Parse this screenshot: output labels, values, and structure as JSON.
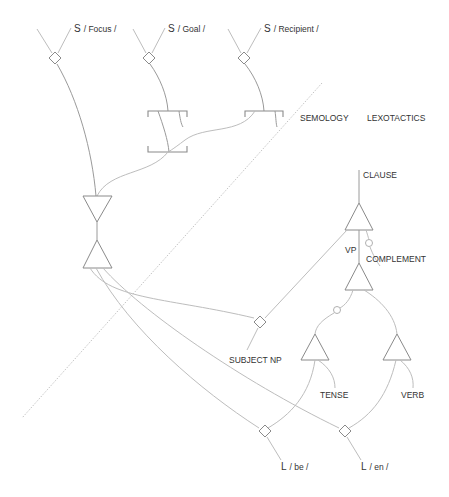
{
  "diagram": {
    "type": "relational-network",
    "regions": {
      "upper_left": "SEMOLOGY",
      "lower_right": "LEXOTACTICS"
    },
    "sememes": [
      {
        "prefix": "S",
        "label": "/ Focus /"
      },
      {
        "prefix": "S",
        "label": "/ Goal /"
      },
      {
        "prefix": "S",
        "label": "/ Recipient /"
      }
    ],
    "lexemes": [
      {
        "prefix": "L",
        "label": "/ be /"
      },
      {
        "prefix": "L",
        "label": "/ en /"
      }
    ],
    "tactic_labels": {
      "clause": "CLAUSE",
      "vp": "VP",
      "complement": "COMPLEMENT",
      "subject_np": "SUBJECT NP",
      "tense": "TENSE",
      "verb": "VERB"
    },
    "node_types": [
      "diamond",
      "ordered-and-bracket",
      "downward-and-triangle",
      "upward-and-triangle",
      "optional-circle"
    ]
  }
}
